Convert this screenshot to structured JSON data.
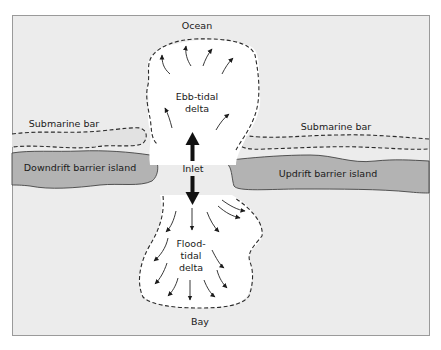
{
  "figure": {
    "type": "tidal-inlet-diagram",
    "colors": {
      "background": "#ececec",
      "frame_border": "#9a9a9a",
      "island_fill": "#b3b3b3",
      "island_stroke": "#444444",
      "delta_fill": "#ffffff",
      "submarine_bar_fill": "#e0e0e0",
      "line": "#2a2a2a"
    }
  },
  "labels": {
    "ocean": "Ocean",
    "bay": "Bay",
    "inlet": "Inlet",
    "ebb_tidal_delta": [
      "Ebb-tidal",
      "delta"
    ],
    "flood_tidal_delta": [
      "Flood-",
      "tidal",
      "delta"
    ],
    "submarine_bar_left": "Submarine bar",
    "submarine_bar_right": "Submarine bar",
    "downdrift_island": "Downdrift barrier island",
    "updrift_island": "Updrift barrier island"
  },
  "features": [
    {
      "name": "Ocean",
      "position": "top"
    },
    {
      "name": "Ebb-tidal delta",
      "position": "seaward of inlet",
      "flow": "outward"
    },
    {
      "name": "Inlet",
      "arrows": [
        "up (ebb)",
        "down (flood)"
      ]
    },
    {
      "name": "Flood-tidal delta",
      "position": "landward of inlet",
      "flow": "inward"
    },
    {
      "name": "Bay",
      "position": "bottom"
    },
    {
      "name": "Downdrift barrier island",
      "side": "left"
    },
    {
      "name": "Updrift barrier island",
      "side": "right"
    },
    {
      "name": "Submarine bar",
      "side": "left"
    },
    {
      "name": "Submarine bar",
      "side": "right"
    }
  ]
}
